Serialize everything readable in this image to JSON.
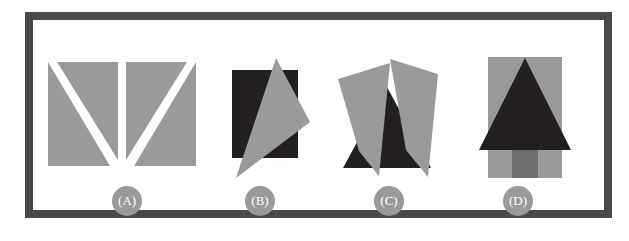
{
  "figure": {
    "background_color": "#ffffff",
    "frame_color": "#4a4a4a",
    "gray_fill": "#9a9a9a",
    "dark_fill": "#231f20",
    "mid_gray_fill": "#6e6e6e",
    "white_fill": "#ffffff",
    "badge_color": "#9a9a9a",
    "badge_text_color": "#ffffff"
  },
  "panels": [
    {
      "id": "panel-a",
      "label": "(A)",
      "description": "two gray rectangles each split by a white diagonal stripe forming a V",
      "badge_x": 112,
      "badge_y": 186
    },
    {
      "id": "panel-b",
      "label": "(B)",
      "description": "dark rectangle overlapped by a large gray triangle",
      "badge_x": 245,
      "badge_y": 186
    },
    {
      "id": "panel-c",
      "label": "(C)",
      "description": "dark triangle flanked by two gray quadrilaterals",
      "badge_x": 374,
      "badge_y": 186
    },
    {
      "id": "panel-d",
      "label": "(D)",
      "description": "gray rectangle with dark triangle and darker gray trunk forming a tree",
      "badge_x": 503,
      "badge_y": 186
    }
  ],
  "shapes": {
    "panel_a": {
      "left_rect": [
        [
          48,
          62
        ],
        [
          118,
          62
        ],
        [
          118,
          166
        ],
        [
          48,
          166
        ]
      ],
      "left_stripe": [
        [
          48,
          62
        ],
        [
          56,
          62
        ],
        [
          118,
          162
        ],
        [
          118,
          166
        ],
        [
          111,
          166
        ]
      ],
      "right_rect": [
        [
          126,
          62
        ],
        [
          196,
          62
        ],
        [
          196,
          166
        ],
        [
          126,
          166
        ]
      ],
      "right_stripe": [
        [
          196,
          62
        ],
        [
          189,
          62
        ],
        [
          128,
          162
        ],
        [
          128,
          166
        ],
        [
          135,
          166
        ]
      ]
    },
    "panel_b": {
      "rect": [
        [
          232,
          70
        ],
        [
          298,
          70
        ],
        [
          298,
          158
        ],
        [
          232,
          158
        ]
      ],
      "triangle": [
        [
          276,
          58
        ],
        [
          310,
          122
        ],
        [
          236,
          178
        ]
      ]
    },
    "panel_c": {
      "triangle": [
        [
          386,
          88
        ],
        [
          430,
          168
        ],
        [
          343,
          168
        ]
      ],
      "left_quad": [
        [
          338,
          78
        ],
        [
          390,
          64
        ],
        [
          379,
          175
        ],
        [
          359,
          151
        ]
      ],
      "right_quad": [
        [
          390,
          60
        ],
        [
          437,
          73
        ],
        [
          428,
          176
        ],
        [
          406,
          150
        ]
      ]
    },
    "panel_d": {
      "rect": [
        [
          488,
          57
        ],
        [
          562,
          57
        ],
        [
          562,
          178
        ],
        [
          488,
          178
        ]
      ],
      "triangle": [
        [
          525,
          60
        ],
        [
          570,
          150
        ],
        [
          480,
          150
        ]
      ],
      "trunk": [
        [
          512,
          150
        ],
        [
          538,
          150
        ],
        [
          538,
          178
        ],
        [
          512,
          178
        ]
      ]
    }
  }
}
